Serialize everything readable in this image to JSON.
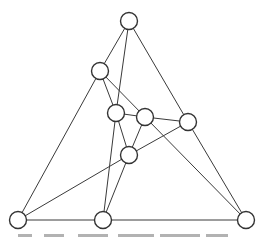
{
  "diagram": {
    "type": "planar-graph",
    "node_radius": 8.5,
    "colors": {
      "edge": "#3a3a3a",
      "node_stroke": "#333333",
      "node_fill": "#ffffff",
      "background": "#ffffff"
    },
    "nodes": [
      {
        "id": "n0",
        "x": 129,
        "y": 21
      },
      {
        "id": "n1",
        "x": 100,
        "y": 71
      },
      {
        "id": "n2",
        "x": 116,
        "y": 113
      },
      {
        "id": "n3",
        "x": 145,
        "y": 117
      },
      {
        "id": "n4",
        "x": 188,
        "y": 122
      },
      {
        "id": "n5",
        "x": 129,
        "y": 155
      },
      {
        "id": "n6",
        "x": 18,
        "y": 220
      },
      {
        "id": "n7",
        "x": 103,
        "y": 220
      },
      {
        "id": "n8",
        "x": 246,
        "y": 220
      }
    ],
    "edges": [
      [
        "n0",
        "n1"
      ],
      [
        "n0",
        "n2"
      ],
      [
        "n0",
        "n4"
      ],
      [
        "n1",
        "n6"
      ],
      [
        "n1",
        "n2"
      ],
      [
        "n1",
        "n3"
      ],
      [
        "n2",
        "n3"
      ],
      [
        "n2",
        "n5"
      ],
      [
        "n2",
        "n7"
      ],
      [
        "n3",
        "n4"
      ],
      [
        "n3",
        "n5"
      ],
      [
        "n3",
        "n8"
      ],
      [
        "n4",
        "n5"
      ],
      [
        "n4",
        "n8"
      ],
      [
        "n5",
        "n6"
      ],
      [
        "n5",
        "n7"
      ],
      [
        "n6",
        "n7"
      ],
      [
        "n7",
        "n8"
      ]
    ]
  },
  "caption": {
    "visible": "truncated (illegible, cut off at bottom edge)",
    "ink_segments": [
      [
        18,
        14
      ],
      [
        44,
        20
      ],
      [
        78,
        30
      ],
      [
        118,
        36
      ],
      [
        160,
        40
      ],
      [
        206,
        22
      ]
    ]
  }
}
